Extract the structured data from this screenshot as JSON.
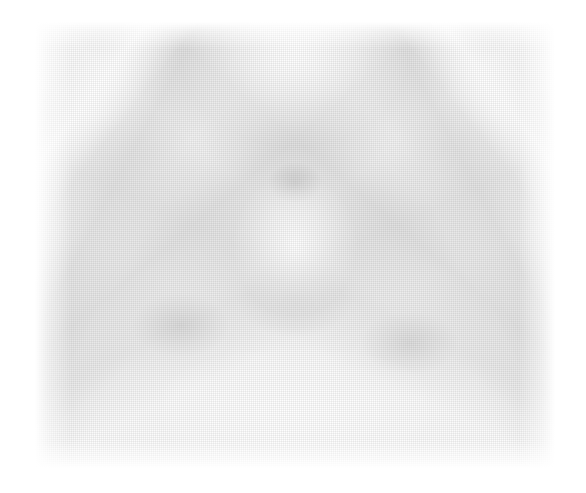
{
  "page": {
    "width": 586,
    "height": 493,
    "background_color": "#ffffff"
  },
  "figure": {
    "kind": "scanned-halftone-grayscale-photograph",
    "content_box": {
      "x": 35,
      "y": 22,
      "width": 520,
      "height": 446
    },
    "margins": {
      "left": 35,
      "top": 22,
      "right": 31,
      "bottom": 25
    },
    "tone": {
      "lightest": "#ffffff",
      "paper": "#fdfdfd",
      "mid": "#eeeeee",
      "darkest": "#c8c8c8"
    },
    "structures": [
      {
        "name": "bright-diagonal-streak-upper-left",
        "position": "upper-left",
        "tone": "#ffffff"
      },
      {
        "name": "bright-diagonal-streak-upper-right",
        "position": "upper-right",
        "tone": "#ffffff"
      },
      {
        "name": "diagonal-band-left-descending",
        "position": "left-of-center",
        "tone": "#dbdbdb"
      },
      {
        "name": "diagonal-band-right-descending",
        "position": "right-of-center",
        "tone": "#dbdbdb"
      },
      {
        "name": "central-dark-nodule",
        "position": "center-upper",
        "tone": "#c8c8c8"
      },
      {
        "name": "central-light-core",
        "position": "center",
        "tone": "#ffffff"
      },
      {
        "name": "diffuse-blob-lower-left",
        "position": "lower-left",
        "tone": "#d0d0d0"
      },
      {
        "name": "diffuse-blob-lower-right",
        "position": "lower-right",
        "tone": "#d0d0d0"
      },
      {
        "name": "chevron-band-lower",
        "position": "lower-center",
        "tone": "#dedede"
      }
    ],
    "symmetry": "bilateral-vertical-mirror",
    "text_elements": []
  }
}
